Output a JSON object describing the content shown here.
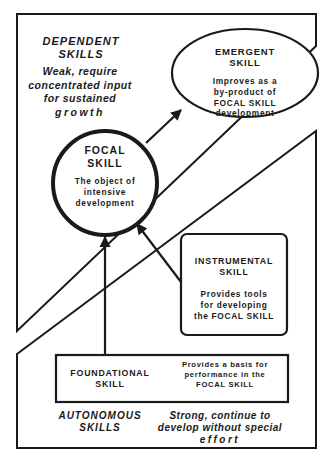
{
  "regions": {
    "dependent": {
      "title_line1": "DEPENDENT",
      "title_line2": "SKILLS",
      "desc_line1": "Weak, require",
      "desc_line2": "concentrated input",
      "desc_line3": "for sustained",
      "desc_line4": "growth"
    },
    "autonomous": {
      "title_line1": "AUTONOMOUS",
      "title_line2": "SKILLS",
      "desc_line1": "Strong, continue to",
      "desc_line2": "develop without special",
      "desc_line3": "effort"
    }
  },
  "nodes": {
    "emergent": {
      "title_line1": "EMERGENT",
      "title_line2": "SKILL",
      "desc_line1": "Improves as a",
      "desc_line2": "by-product of",
      "desc_line3": "FOCAL SKILL",
      "desc_line4": "development"
    },
    "focal": {
      "title_line1": "FOCAL",
      "title_line2": "SKILL",
      "desc_line1": "The object of",
      "desc_line2": "intensive",
      "desc_line3": "development"
    },
    "instrumental": {
      "title_line1": "INSTRUMENTAL",
      "title_line2": "SKILL",
      "desc_line1": "Provides tools",
      "desc_line2": "for developing",
      "desc_line3": "the FOCAL SKILL"
    },
    "foundational": {
      "title_line1": "FOUNDATIONAL",
      "title_line2": "SKILL",
      "desc_line1": "Provides a basis for",
      "desc_line2": "performance in the",
      "desc_line3": "FOCAL SKILL"
    }
  },
  "edges": [
    {
      "from": "focal",
      "to": "emergent"
    },
    {
      "from": "instrumental",
      "to": "focal"
    },
    {
      "from": "foundational",
      "to": "focal"
    }
  ],
  "colors": {
    "ink": "#1a1a1a",
    "background": "#ffffff"
  }
}
